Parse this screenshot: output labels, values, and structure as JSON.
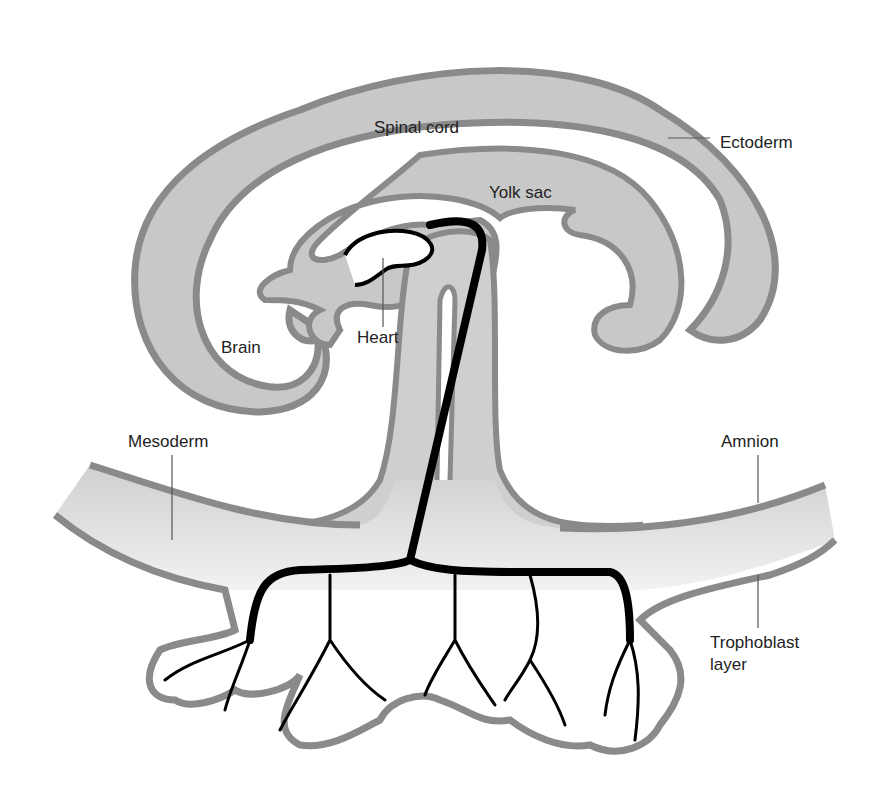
{
  "colors": {
    "tissue_fill": "#c8c8c8",
    "tissue_outline": "#8a8a8a",
    "vessel": "#000000",
    "label_text": "#222222",
    "leader_line": "#555555",
    "background": "#ffffff"
  },
  "labels": {
    "spinal_cord": "Spinal cord",
    "ectoderm": "Ectoderm",
    "yolk_sac": "Yolk sac",
    "brain": "Brain",
    "heart": "Heart",
    "mesoderm": "Mesoderm",
    "amnion": "Amnion",
    "trophoblast": "Trophoblast\nlayer"
  }
}
